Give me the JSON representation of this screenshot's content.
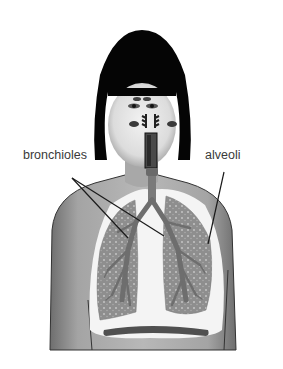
{
  "diagram": {
    "labels": {
      "bronchioles": "bronchioles",
      "alveoli": "alveoli"
    },
    "colors": {
      "hair": "#050505",
      "skin": "#9a9a9a",
      "skin_light": "#d8d8d8",
      "lung": "#8c8c8c",
      "airway": "#6a6a6a",
      "leader_line": "#1a1a1a"
    }
  }
}
